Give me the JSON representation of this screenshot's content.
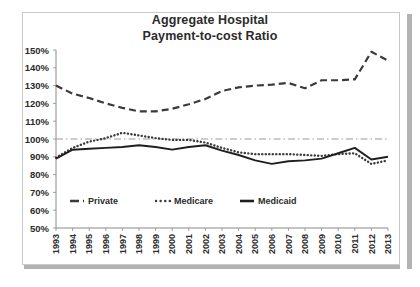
{
  "chart_data": {
    "type": "line",
    "title": "Aggregate Hospital Payment-to-cost Ratio",
    "title_line1": "Aggregate Hospital",
    "title_line2": "Payment-to-cost Ratio",
    "xlabel": "",
    "ylabel": "",
    "ylim": [
      50,
      150
    ],
    "ytick_step": 10,
    "grid": false,
    "legend_position": "inside-bottom-left",
    "reference_line": {
      "value": 100,
      "style": "dash-dot",
      "color": "#9a9a9a"
    },
    "ytick_labels": [
      "150%",
      "140%",
      "130%",
      "120%",
      "110%",
      "100%",
      "90%",
      "80%",
      "70%",
      "60%",
      "50%"
    ],
    "categories": [
      "1993",
      "1994",
      "1995",
      "1996",
      "1997",
      "1998",
      "1999",
      "2000",
      "2001",
      "2002",
      "2003",
      "2004",
      "2005",
      "2006",
      "2007",
      "2008",
      "2009",
      "2010",
      "2011",
      "2012",
      "2013"
    ],
    "series": [
      {
        "name": "Private",
        "style": "dashed",
        "color": "#3a3a3a",
        "values": [
          130,
          125.5,
          123,
          120,
          117.5,
          115.5,
          115.5,
          117,
          119.5,
          122.5,
          127,
          129,
          130,
          130.5,
          131.5,
          128.5,
          133,
          133,
          133.5,
          149,
          144
        ]
      },
      {
        "name": "Medicare",
        "style": "dotted",
        "color": "#3a3a3a",
        "values": [
          89.5,
          95,
          98.5,
          100.5,
          103.5,
          102,
          100.5,
          99.5,
          99.5,
          98,
          95,
          92.5,
          91.5,
          91.5,
          91.5,
          91,
          90.5,
          91.5,
          92,
          86,
          88
        ]
      },
      {
        "name": "Medicaid",
        "style": "solid",
        "color": "#1f1f1f",
        "values": [
          89,
          94,
          94.5,
          95,
          95.5,
          96.5,
          95.5,
          94,
          95.5,
          96.5,
          93.5,
          91,
          88,
          86,
          87.5,
          88,
          89,
          92,
          95,
          88.5,
          90
        ]
      }
    ]
  },
  "legend": [
    {
      "label": "Private",
      "marker": "dashed-line-marker"
    },
    {
      "label": "Medicare",
      "marker": "dotted-line-marker"
    },
    {
      "label": "Medicaid",
      "marker": "solid-line-marker"
    }
  ]
}
